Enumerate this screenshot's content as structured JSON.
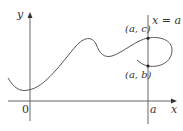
{
  "diagram": {
    "axes": {
      "x_label": "x",
      "y_label": "y",
      "origin_label": "0"
    },
    "vertical_line": {
      "label": "x = a",
      "x_tick_label": "a"
    },
    "points": [
      {
        "label": "(a, c)"
      },
      {
        "label": "(a, b)"
      }
    ],
    "colors": {
      "line": "#555555",
      "text": "#333333",
      "point": "#222222"
    }
  }
}
